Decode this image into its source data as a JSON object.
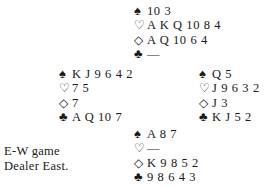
{
  "deal": {
    "north": {
      "spades": "10 3",
      "hearts": "A K Q 10 8 4",
      "diamonds": "A Q 10 6 4",
      "clubs": "—"
    },
    "west": {
      "spades": "K J 9 6 4 2",
      "hearts": "7 5",
      "diamonds": "7",
      "clubs": "A Q 10 7"
    },
    "east": {
      "spades": "Q 5",
      "hearts": "J 9 6 3 2",
      "diamonds": "J 3",
      "clubs": "K J 5 2"
    },
    "south": {
      "spades": "A 8 7",
      "hearts": "—",
      "diamonds": "K 9 8 5 2",
      "clubs": "9 8 6 4 3"
    }
  },
  "icons": {
    "spade": "♠",
    "heart": "♡",
    "diamond": "◇",
    "club": "♣"
  },
  "notes": {
    "vulnerability": "E-W game",
    "dealer": "Dealer East."
  }
}
